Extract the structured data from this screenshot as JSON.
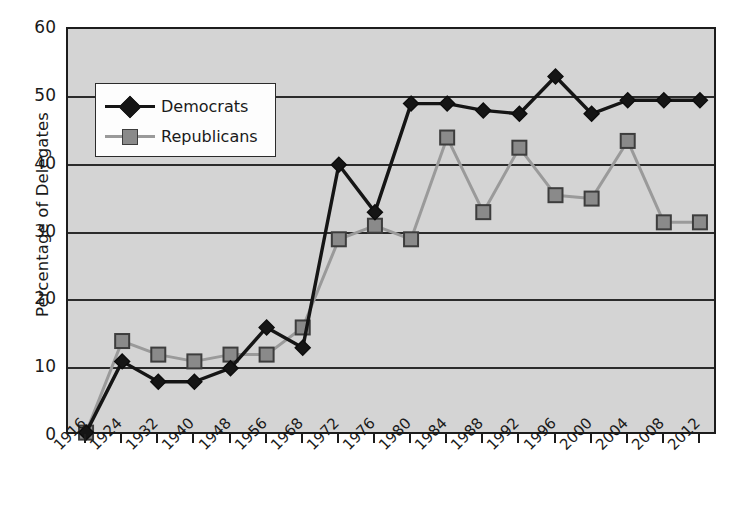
{
  "chart_data": {
    "type": "line",
    "title": "",
    "xlabel": "",
    "ylabel": "Percentage of Delegates",
    "ylim": [
      0,
      60
    ],
    "yticks": [
      0,
      10,
      20,
      30,
      40,
      50,
      60
    ],
    "grid": true,
    "legend_position": "upper-left",
    "categories": [
      "1916",
      "1924",
      "1932",
      "1940",
      "1948",
      "1956",
      "1968",
      "1972",
      "1976",
      "1980",
      "1984",
      "1988",
      "1992",
      "1996",
      "2000",
      "2004",
      "2008",
      "2012"
    ],
    "series": [
      {
        "name": "Democrats",
        "marker": "diamond",
        "color": "#151515",
        "values": [
          0.5,
          11,
          8,
          8,
          10,
          16,
          13,
          40,
          33,
          49,
          49,
          48,
          47.5,
          53,
          47.5,
          49.5,
          49.5,
          49.5
        ]
      },
      {
        "name": "Republicans",
        "marker": "square",
        "color": "#8a8a8a",
        "values": [
          0.5,
          14,
          12,
          11,
          12,
          12,
          16,
          29,
          31,
          29,
          44,
          33,
          42.5,
          35.5,
          35,
          43.5,
          31.5,
          31.5
        ]
      }
    ]
  },
  "legend": {
    "items": [
      {
        "label": "Democrats"
      },
      {
        "label": "Republicans"
      }
    ]
  },
  "colors": {
    "plot_background": "#d4d4d4",
    "axis": "#1c1c1c",
    "democrat": "#151515",
    "republican": "#8a8a8a",
    "page_background": "#ffffff"
  }
}
